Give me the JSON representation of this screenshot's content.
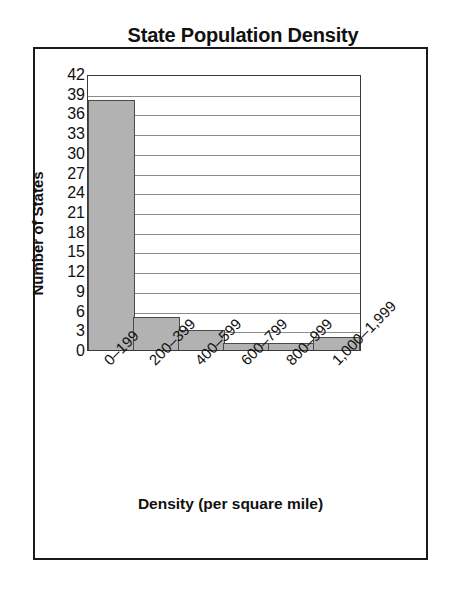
{
  "chart_data": {
    "type": "bar",
    "title": "State Population Density",
    "xlabel": "Density (per square mile)",
    "ylabel": "Number of States",
    "categories": [
      "0–199",
      "200–399",
      "400–599",
      "600–799",
      "800–999",
      "1,000–1,999"
    ],
    "values": [
      38,
      5,
      3,
      1,
      1,
      2
    ],
    "ylim": [
      0,
      42
    ],
    "ytick_step": 3,
    "yticks": [
      42,
      39,
      36,
      33,
      30,
      27,
      24,
      21,
      18,
      15,
      12,
      9,
      6,
      3,
      0
    ],
    "grid": true,
    "legend": null,
    "bar_fill_color": "#b2b2b2",
    "bar_edge_color": "#4a4a4a",
    "gridline_color": "#8c8c8c",
    "axis_color": "#3a3a3a",
    "background_color": "#ffffff"
  }
}
